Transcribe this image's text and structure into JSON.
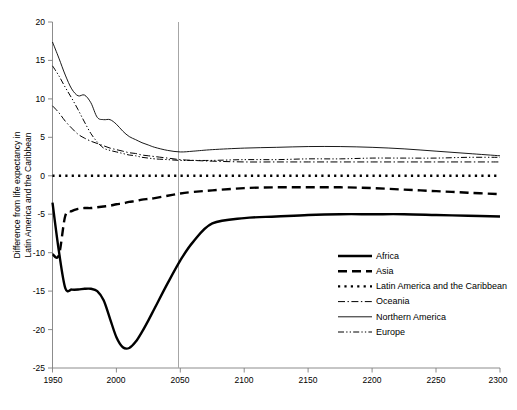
{
  "chart_data": {
    "type": "line",
    "title": "",
    "xlabel": "",
    "ylabel": "Difference from life expectancy in Latin America and the Caribbean",
    "ylabel_line1": "Difference from life expectancy in",
    "ylabel_line2": "Latin America and the Caribbean",
    "xlim": [
      1950,
      2300
    ],
    "ylim": [
      -25,
      20
    ],
    "xticks": [
      1950,
      2000,
      2050,
      2100,
      2150,
      2200,
      2250,
      2300
    ],
    "xticklabels": [
      "1950",
      "2000",
      "2050",
      "2100",
      "2150",
      "2200",
      "2250",
      "2300"
    ],
    "yticks": [
      -25,
      -20,
      -15,
      -10,
      -5,
      0,
      5,
      10,
      15,
      20
    ],
    "yticklabels": [
      "-25",
      "-20",
      "-15",
      "-10",
      "-5",
      "0",
      "5",
      "10",
      "15",
      "20"
    ],
    "grid": false,
    "legend_position": "center-right",
    "annotations": [
      {
        "name": "projection-divider",
        "type": "vline",
        "x": 2050,
        "color": "#a6a6a6"
      }
    ],
    "x": [
      1950,
      1955,
      1960,
      1965,
      1970,
      1975,
      1980,
      1985,
      1990,
      1995,
      2000,
      2005,
      2010,
      2015,
      2020,
      2025,
      2030,
      2040,
      2050,
      2060,
      2075,
      2100,
      2125,
      2150,
      2175,
      2200,
      2225,
      2250,
      2275,
      2300
    ],
    "series": [
      {
        "name": "Africa",
        "style": "solid-thick",
        "color": "#000000",
        "values": [
          -3.5,
          -9.8,
          -14.6,
          -14.8,
          -14.8,
          -14.7,
          -14.7,
          -15.0,
          -16.2,
          -18.6,
          -21.0,
          -22.3,
          -22.4,
          -21.6,
          -20.3,
          -18.8,
          -17.2,
          -14.0,
          -11.0,
          -8.6,
          -6.2,
          -5.5,
          -5.3,
          -5.1,
          -5.0,
          -5.0,
          -5.0,
          -5.1,
          -5.2,
          -5.3
        ]
      },
      {
        "name": "Asia",
        "style": "dashed-thick",
        "color": "#000000",
        "values": [
          -10.2,
          -10.3,
          -5.2,
          -4.6,
          -4.3,
          -4.2,
          -4.2,
          -4.1,
          -4.0,
          -3.9,
          -3.7,
          -3.6,
          -3.4,
          -3.3,
          -3.1,
          -3.0,
          -2.9,
          -2.6,
          -2.3,
          -2.1,
          -1.9,
          -1.6,
          -1.5,
          -1.5,
          -1.5,
          -1.6,
          -1.8,
          -2.0,
          -2.2,
          -2.4
        ]
      },
      {
        "name": "Latin America and the Caribbean",
        "style": "dotted-thick",
        "color": "#000000",
        "values": [
          0,
          0,
          0,
          0,
          0,
          0,
          0,
          0,
          0,
          0,
          0,
          0,
          0,
          0,
          0,
          0,
          0,
          0,
          0,
          0,
          0,
          0,
          0,
          0,
          0,
          0,
          0,
          0,
          0,
          0
        ]
      },
      {
        "name": "Oceania",
        "style": "dashdot",
        "color": "#000000",
        "values": [
          9.1,
          8.2,
          7.1,
          6.2,
          5.4,
          4.9,
          4.5,
          4.2,
          3.9,
          3.6,
          3.4,
          3.2,
          3.0,
          2.9,
          2.7,
          2.6,
          2.5,
          2.3,
          2.1,
          2.0,
          1.9,
          1.8,
          1.8,
          1.8,
          1.8,
          1.8,
          1.8,
          1.8,
          1.8,
          1.8
        ]
      },
      {
        "name": "Northern America",
        "style": "solid-thin",
        "color": "#000000",
        "values": [
          17.4,
          15.3,
          13.1,
          11.3,
          10.4,
          10.5,
          9.5,
          7.6,
          7.3,
          7.3,
          6.7,
          5.8,
          5.1,
          4.7,
          4.3,
          4.0,
          3.7,
          3.3,
          3.1,
          3.2,
          3.4,
          3.6,
          3.7,
          3.8,
          3.8,
          3.7,
          3.5,
          3.2,
          2.9,
          2.6
        ]
      },
      {
        "name": "Europe",
        "style": "dashdotdot",
        "color": "#000000",
        "values": [
          14.3,
          13.0,
          11.5,
          10.1,
          8.6,
          7.0,
          5.5,
          4.4,
          3.6,
          3.3,
          3.1,
          2.9,
          2.7,
          2.6,
          2.4,
          2.3,
          2.2,
          2.1,
          2.0,
          2.0,
          2.0,
          2.1,
          2.1,
          2.2,
          2.2,
          2.3,
          2.3,
          2.3,
          2.4,
          2.4
        ]
      }
    ]
  },
  "legend": {
    "items": [
      {
        "label": "Africa",
        "style": "solid-thick"
      },
      {
        "label": "Asia",
        "style": "dashed-thick"
      },
      {
        "label": "Latin America and the Caribbean",
        "style": "dotted-thick"
      },
      {
        "label": "Oceania",
        "style": "dashdot"
      },
      {
        "label": "Northern America",
        "style": "solid-thin"
      },
      {
        "label": "Europe",
        "style": "dashdotdot"
      }
    ]
  },
  "colors": {
    "series": "#000000",
    "axis": "#7f7f7f",
    "divider": "#a6a6a6",
    "background": "#ffffff"
  }
}
